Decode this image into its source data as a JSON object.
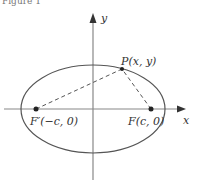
{
  "figure": {
    "caption_fragment": "Figure 1",
    "type": "ellipse-foci-diagram"
  },
  "axes": {
    "x_label": "x",
    "y_label": "y"
  },
  "points": {
    "P": {
      "label": "P(x, y)"
    },
    "F": {
      "label": "F(c, 0)"
    },
    "F_prime": {
      "label": "F′(−c, 0)"
    }
  },
  "colors": {
    "stroke": "#555555",
    "axis": "#888888",
    "text": "#333333"
  }
}
